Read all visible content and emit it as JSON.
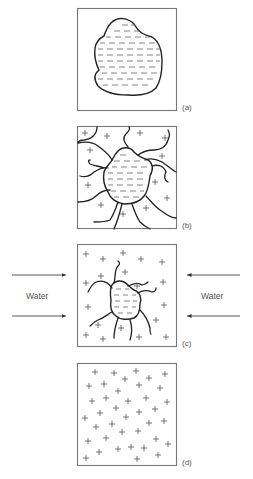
{
  "figure": {
    "panels": [
      {
        "id": "a",
        "label": "(a)",
        "description": "Closed box containing a single water-filled blob (dashes)"
      },
      {
        "id": "b",
        "label": "(b)",
        "description": "Blob surrounded by cracks radiating to the edges, plus signs between cracks"
      },
      {
        "id": "c",
        "label": "(c)",
        "description": "Smaller blob with short cracks, many plus signs, water pushing in from both sides"
      },
      {
        "id": "d",
        "label": "(d)",
        "description": "Box filled only with plus signs"
      }
    ],
    "water_labels": {
      "left": "Water",
      "right": "Water"
    },
    "colors": {
      "outline": "#222222",
      "box": "#777777",
      "text": "#555555",
      "background": "#ffffff"
    }
  }
}
